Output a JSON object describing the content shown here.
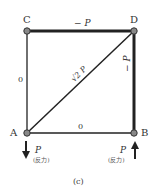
{
  "diagram": {
    "caption": "(c)",
    "nodes": {
      "A": {
        "label": "A"
      },
      "B": {
        "label": "B"
      },
      "C": {
        "label": "C"
      },
      "D": {
        "label": "D"
      }
    },
    "members": {
      "CD": {
        "force": "− P"
      },
      "DB": {
        "force": "− P"
      },
      "AD": {
        "force": "√2 P"
      },
      "CA": {
        "force": "0"
      },
      "AB": {
        "force": "0"
      }
    },
    "reactions": {
      "A": {
        "force": "P",
        "note": "(反力)",
        "direction": "down"
      },
      "B": {
        "force": "P",
        "note": "(反力)",
        "direction": "up"
      }
    },
    "colors": {
      "line": "#222222",
      "node_fill": "#888888"
    }
  }
}
